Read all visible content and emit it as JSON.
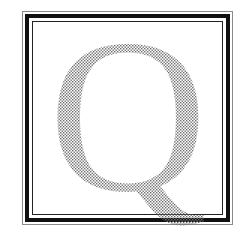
{
  "illustration": {
    "letter": "Q",
    "fill_style": "halftone-dots",
    "dot_color": "#6e6e6e",
    "background_color": "#ffffff",
    "frame": {
      "outer_line_color": "#8a8a8a",
      "thick_line_color": "#111111",
      "inner_line_color": "#222222"
    }
  }
}
